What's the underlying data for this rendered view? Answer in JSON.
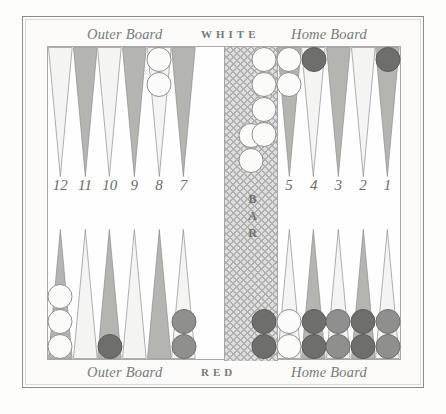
{
  "board": {
    "title": "Backgammon board diagram",
    "labels": {
      "top_left": "Outer Board",
      "top_center": "WHITE",
      "top_right": "Home Board",
      "bottom_left": "Outer Board",
      "bottom_center": "RED",
      "bottom_right": "Home Board",
      "bar": "BAR"
    },
    "point_numbers": [
      "12",
      "11",
      "10",
      "9",
      "8",
      "7",
      "6",
      "5",
      "4",
      "3",
      "2",
      "1"
    ],
    "colors": {
      "point_light": "#f4f4f3",
      "point_dark": "#b4b4b1",
      "checker_white": "#fbfbfa",
      "checker_red": "#8f8f8d",
      "checker_red_dark": "#6e6e6c",
      "bar": "#dedede",
      "frame": "#8d8d8d",
      "text": "#6b6b69"
    },
    "top_points": [
      {
        "number": "12",
        "shade": "light",
        "checkers": []
      },
      {
        "number": "11",
        "shade": "dark",
        "checkers": []
      },
      {
        "number": "10",
        "shade": "light",
        "checkers": []
      },
      {
        "number": "9",
        "shade": "dark",
        "checkers": []
      },
      {
        "number": "8",
        "shade": "light",
        "checkers": [
          "white",
          "white"
        ]
      },
      {
        "number": "7",
        "shade": "dark",
        "checkers": []
      },
      {
        "number": "6",
        "shade": "light",
        "checkers": [
          "white",
          "white",
          "white",
          "white"
        ]
      },
      {
        "number": "5",
        "shade": "dark",
        "checkers": [
          "white",
          "white"
        ]
      },
      {
        "number": "4",
        "shade": "light",
        "checkers": [
          "red-dark"
        ]
      },
      {
        "number": "3",
        "shade": "dark",
        "checkers": []
      },
      {
        "number": "2",
        "shade": "light",
        "checkers": []
      },
      {
        "number": "1",
        "shade": "dark",
        "checkers": [
          "red-dark"
        ]
      }
    ],
    "bottom_points": [
      {
        "number": "12",
        "shade": "dark",
        "checkers": [
          "white",
          "white",
          "white"
        ]
      },
      {
        "number": "11",
        "shade": "light",
        "checkers": []
      },
      {
        "number": "10",
        "shade": "dark",
        "checkers": [
          "red-dark"
        ]
      },
      {
        "number": "9",
        "shade": "light",
        "checkers": []
      },
      {
        "number": "8",
        "shade": "dark",
        "checkers": []
      },
      {
        "number": "7",
        "shade": "light",
        "checkers": [
          "red",
          "red"
        ]
      },
      {
        "number": "6",
        "shade": "dark",
        "checkers": [
          "red-dark",
          "red-dark"
        ]
      },
      {
        "number": "5",
        "shade": "light",
        "checkers": [
          "white",
          "white"
        ]
      },
      {
        "number": "4",
        "shade": "dark",
        "checkers": [
          "red-dark",
          "red-dark"
        ]
      },
      {
        "number": "3",
        "shade": "light",
        "checkers": [
          "red",
          "red"
        ]
      },
      {
        "number": "2",
        "shade": "dark",
        "checkers": [
          "red-dark",
          "red-dark"
        ]
      },
      {
        "number": "1",
        "shade": "light",
        "checkers": [
          "red",
          "red"
        ]
      }
    ],
    "bar_checkers": [
      "white",
      "white"
    ]
  }
}
